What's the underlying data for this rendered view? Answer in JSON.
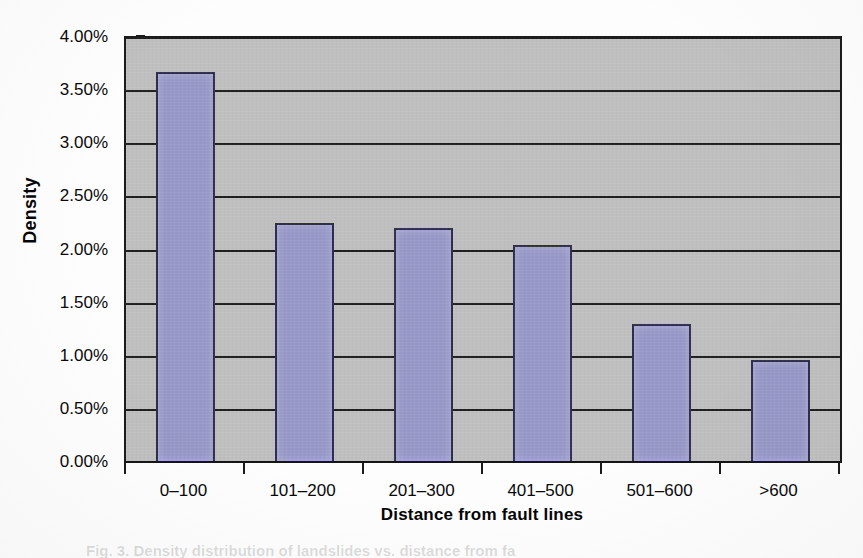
{
  "chart_data": {
    "type": "bar",
    "title": "",
    "xlabel": "Distance from fault lines",
    "ylabel": "Density",
    "categories": [
      "0–100",
      "101–200",
      "201–300",
      "401–500",
      "501–600",
      ">600"
    ],
    "values": [
      3.68,
      2.26,
      2.21,
      2.05,
      1.31,
      0.97
    ],
    "value_labels": [
      "3.68%",
      "2.26%",
      "2.21%",
      "2.05%",
      "1.31%",
      "0.97%"
    ],
    "ylim": [
      0,
      4
    ],
    "ytick_step": 0.5,
    "ytick_labels": [
      "0.00%",
      "0.50%",
      "1.00%",
      "1.50%",
      "2.00%",
      "2.50%",
      "3.00%",
      "3.50%",
      "4.00%"
    ],
    "ytick_values": [
      0,
      0.5,
      1,
      1.5,
      2,
      2.5,
      3,
      3.5,
      4
    ],
    "grid": "horizontal",
    "legend": "none",
    "series": [
      {
        "name": "Density",
        "values": [
          3.68,
          2.26,
          2.21,
          2.05,
          1.31,
          0.97
        ]
      }
    ]
  },
  "style": {
    "plot_background": "#c2c2c2",
    "bar_fill": "#9a9acb",
    "bar_border": "#2d2d4e",
    "gridline_color": "#1e1e1e",
    "axis_color": "#151515",
    "text_color": "#090909",
    "page_background": "#fdfdfd"
  },
  "caption": {
    "text": "Fig. 3. Density distribution of landslides vs. distance from fault lines"
  }
}
